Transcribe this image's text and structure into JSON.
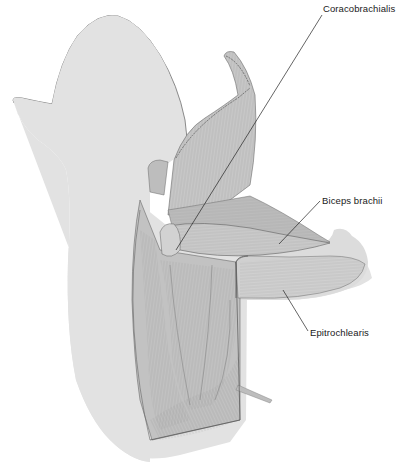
{
  "figure": {
    "colors": {
      "background": "#ffffff",
      "skin": "#e2e2e2",
      "skin_outline": "#6e6e6e",
      "muscle_light": "#d0d0d0",
      "muscle_mid": "#b4b4b4",
      "muscle_dark": "#8a8a8a",
      "fiber": "#7a7a7a",
      "leader_line": "#222222",
      "label_text": "#1a1a1a"
    },
    "labels": [
      {
        "text": "Coracobrachialis",
        "x": 323,
        "y": 5,
        "line": {
          "x1": 322,
          "y1": 15,
          "x2": 176,
          "y2": 250
        }
      },
      {
        "text": "Biceps brachii",
        "x": 322,
        "y": 190,
        "line": {
          "x1": 320,
          "y1": 201,
          "x2": 279,
          "y2": 244
        }
      },
      {
        "text": "Epitrochlearis",
        "x": 310,
        "y": 321,
        "line": {
          "x1": 283,
          "y1": 290,
          "x2": 308,
          "y2": 331
        }
      }
    ]
  }
}
